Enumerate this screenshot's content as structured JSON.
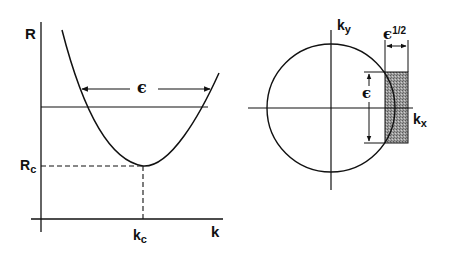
{
  "figure": {
    "left_panel": {
      "y_axis_label": "R",
      "x_axis_label": "k",
      "critical_r_label": {
        "main": "R",
        "sub": "c"
      },
      "critical_k_label": {
        "main": "k",
        "sub": "c"
      },
      "band_label": "ϵ"
    },
    "right_panel": {
      "ky_label": {
        "main": "k",
        "sub": "y"
      },
      "kx_label": {
        "main": "k",
        "sub": "x"
      },
      "height_label": "ϵ",
      "width_label": {
        "main": "ϵ",
        "sup": "1/2"
      }
    },
    "colors": {
      "ink": "#111111",
      "shade": "#8a8a8a",
      "background": "#ffffff"
    }
  }
}
